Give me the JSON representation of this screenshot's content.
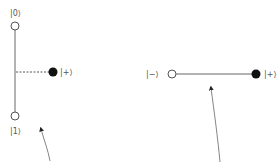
{
  "left_diagram": {
    "top_label": "|0⟩",
    "bottom_label": "|1⟩",
    "point_label": "|+⟩"
  },
  "right_diagram": {
    "left_label": "|−⟩",
    "right_label": "|+⟩"
  },
  "colors": {
    "line": "#666666",
    "filled": "#111111",
    "open_fill": "#ffffff",
    "label": "#555555"
  }
}
